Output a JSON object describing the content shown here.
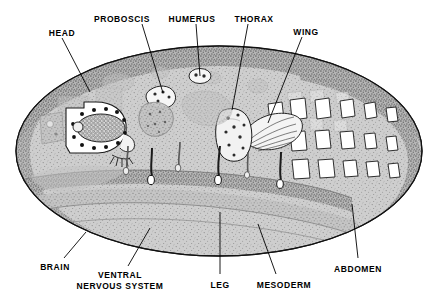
{
  "figure": {
    "organism": "Drosophila third-instar larva",
    "view": "lateral schematic",
    "background_color": "#ffffff",
    "body_fill": "#c9c9c9",
    "body_rim_color": "#8d8d8d",
    "outline_color": "#000000",
    "disc_fill": "#ffffff",
    "leader_color": "#000000"
  },
  "labels": [
    {
      "id": "head",
      "text": "HEAD",
      "text2": "",
      "x": 62,
      "y": 28,
      "anchor": "center",
      "leader": [
        [
          62,
          38
        ],
        [
          90,
          92
        ]
      ]
    },
    {
      "id": "proboscis",
      "text": "PROBOSCIS",
      "text2": "",
      "x": 122,
      "y": 14,
      "anchor": "center",
      "leader": [
        [
          142,
          24
        ],
        [
          163,
          93
        ]
      ]
    },
    {
      "id": "humerus",
      "text": "HUMERUS",
      "text2": "",
      "x": 192,
      "y": 14,
      "anchor": "center",
      "leader": [
        [
          196,
          24
        ],
        [
          200,
          76
        ]
      ]
    },
    {
      "id": "thorax",
      "text": "THORAX",
      "text2": "",
      "x": 254,
      "y": 14,
      "anchor": "center",
      "leader": [
        [
          248,
          24
        ],
        [
          232,
          110
        ]
      ]
    },
    {
      "id": "wing",
      "text": "WING",
      "text2": "",
      "x": 306,
      "y": 27,
      "anchor": "center",
      "leader": [
        [
          302,
          37
        ],
        [
          268,
          123
        ]
      ]
    },
    {
      "id": "brain",
      "text": "BRAIN",
      "text2": "",
      "x": 55,
      "y": 262,
      "anchor": "center",
      "leader": [
        [
          64,
          258
        ],
        [
          86,
          232
        ]
      ]
    },
    {
      "id": "ventral-nervous-system",
      "text": "VENTRAL",
      "text2": "NERVOUS SYSTEM",
      "x": 120,
      "y": 270,
      "anchor": "center",
      "leader": [
        [
          128,
          266
        ],
        [
          150,
          228
        ]
      ]
    },
    {
      "id": "leg",
      "text": "LEG",
      "text2": "",
      "x": 220,
      "y": 280,
      "anchor": "center",
      "leader": [
        [
          220,
          274
        ],
        [
          220,
          212
        ]
      ]
    },
    {
      "id": "mesoderm",
      "text": "MESODERM",
      "text2": "",
      "x": 284,
      "y": 280,
      "anchor": "center",
      "leader": [
        [
          276,
          274
        ],
        [
          258,
          224
        ]
      ]
    },
    {
      "id": "abdomen",
      "text": "ABDOMEN",
      "text2": "",
      "x": 358,
      "y": 264,
      "anchor": "center",
      "leader": [
        [
          358,
          258
        ],
        [
          352,
          204
        ]
      ]
    }
  ],
  "structures": [
    {
      "name": "larval-body",
      "type": "ellipse",
      "note": "stippled ellipse with dark rim"
    },
    {
      "name": "eye-antennal-disc",
      "type": "disc",
      "note": "white polygon with ommatidial mesh oval and ring of dots"
    },
    {
      "name": "proboscis-disc",
      "type": "disc",
      "note": "small spotted lobe"
    },
    {
      "name": "humerus-disc",
      "type": "disc",
      "note": "small oval with two dots"
    },
    {
      "name": "thorax-disc",
      "type": "disc",
      "note": "large stippled lobe with dots"
    },
    {
      "name": "wing-disc",
      "type": "disc",
      "note": "fan shape with radiating veins"
    },
    {
      "name": "leg-discs",
      "type": "disc-set",
      "count": 3,
      "note": "curved stalks with white teardrop tips"
    },
    {
      "name": "abdominal-histoblasts",
      "type": "disc-set",
      "count": 16,
      "note": "two rows of white quadrilateral nests"
    },
    {
      "name": "ventral-nerve-cord",
      "type": "band",
      "note": "dark stippled ventral band"
    },
    {
      "name": "mesoderm",
      "type": "band",
      "note": "stippled band below nerve cord"
    }
  ]
}
